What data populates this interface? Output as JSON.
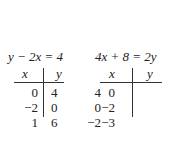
{
  "tables": [
    {
      "equation": "y − 2x = 4",
      "headers": {
        "x": "x",
        "y": "y"
      },
      "rows": [
        {
          "x": "0",
          "y": "4"
        },
        {
          "x": "−2",
          "y": "0"
        },
        {
          "x": "1",
          "y": "6"
        }
      ]
    },
    {
      "equation": "4x + 8 = 2y",
      "headers": {
        "x": "x",
        "y": "y"
      },
      "rows": [
        {
          "x": "0",
          "y": "4"
        },
        {
          "x": "−2",
          "y": "0"
        },
        {
          "x": "−3",
          "y": "−2"
        }
      ]
    }
  ]
}
